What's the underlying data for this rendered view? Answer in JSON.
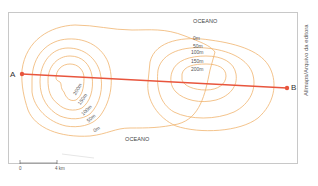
{
  "map": {
    "title": "",
    "ocean_labels": [
      "OCEANO",
      "OCEANO"
    ],
    "points": {
      "a": "A",
      "b": "B"
    },
    "left_island_contours": [
      "200m",
      "150m",
      "100m",
      "50m",
      "0m"
    ],
    "right_island_contours": [
      "0m",
      "50m",
      "100m",
      "150m",
      "200m"
    ],
    "scale": {
      "start": "0",
      "end": "4 km"
    },
    "credit": "Allmaps/Arquivo da editora",
    "colors": {
      "contour": "#f0b46e",
      "profile_line": "#e8553d",
      "frame": "#c8c8c8"
    }
  }
}
